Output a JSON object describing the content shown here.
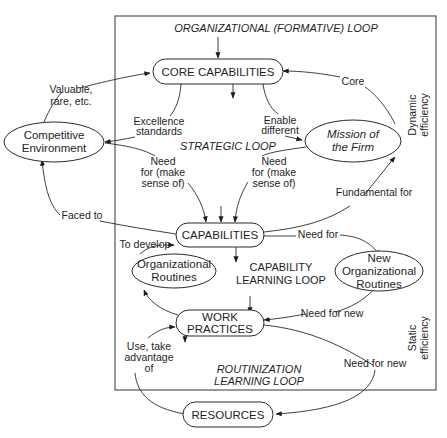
{
  "frame": {
    "title": "ORGANIZATIONAL (FORMATIVE) LOOP"
  },
  "loops": {
    "strategic": "STRATEGIC LOOP",
    "capability": [
      "CAPABILITY",
      "LEARNING LOOP"
    ],
    "routinization": [
      "ROUTINIZATION",
      "LEARNING LOOP"
    ]
  },
  "side_labels": {
    "dynamic": [
      "Dynamic",
      "efficiency"
    ],
    "static": [
      "Static",
      "efficiency"
    ]
  },
  "nodes": {
    "core_capabilities": "CORE CAPABILITIES",
    "competitive_environment": [
      "Competitive",
      "Environment"
    ],
    "mission": [
      "Mission of",
      "the Firm"
    ],
    "capabilities": "CAPABILITIES",
    "org_routines": [
      "Organizational",
      "Routines"
    ],
    "new_org_routines": [
      "New",
      "Organizational",
      "Routines"
    ],
    "work_practices": [
      "WORK",
      "PRACTICES"
    ],
    "resources": "RESOURCES"
  },
  "edge_labels": {
    "valuable": [
      "Valuable,",
      "rare, etc."
    ],
    "excellence": [
      "Excellence",
      "standards"
    ],
    "enable": [
      "Enable",
      "different"
    ],
    "core": "Core",
    "need_left": [
      "Need",
      "for (make",
      "sense of)"
    ],
    "need_right": [
      "Need",
      "for (make",
      "sense of)"
    ],
    "faced_to": "Faced to",
    "fundamental_for": "Fundamental for",
    "to_develop": "To develop",
    "need_for": "Need for",
    "need_for_new_1": "Need for new",
    "need_for_new_2": "Need for new",
    "use_take": [
      "Use, take",
      "advantage",
      "of"
    ]
  }
}
